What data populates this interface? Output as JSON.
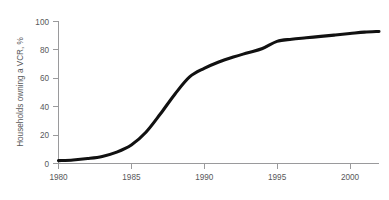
{
  "chart_data": {
    "type": "line",
    "title": "",
    "subtitle": "",
    "xlabel": "",
    "ylabel": "Households owning a VCR, %",
    "xlim": [
      1980,
      2002
    ],
    "ylim": [
      0,
      100
    ],
    "grid": false,
    "legend": "none",
    "x_ticks": [
      1980,
      1985,
      1990,
      1995,
      2000
    ],
    "x_tick_labels": [
      "1980",
      "1985",
      "1990",
      "1995",
      "2000"
    ],
    "y_ticks": [
      0,
      20,
      40,
      60,
      80,
      100
    ],
    "y_tick_labels": [
      "0",
      "20",
      "40",
      "60",
      "80",
      "100"
    ],
    "series": [
      {
        "name": "Households owning a VCR",
        "color": "#111111",
        "x": [
          1980,
          1981,
          1982,
          1983,
          1984,
          1985,
          1986,
          1987,
          1988,
          1989,
          1990,
          1991,
          1992,
          1993,
          1994,
          1995,
          1996,
          1997,
          1998,
          1999,
          2000,
          2001,
          2002
        ],
        "values": [
          2,
          2.5,
          3.5,
          5,
          8,
          13,
          22,
          35,
          49,
          61,
          67,
          71.5,
          75,
          78,
          81,
          86,
          87.5,
          88.5,
          89.5,
          90.5,
          91.5,
          92.5,
          93
        ]
      }
    ],
    "annotations": []
  },
  "figure": {
    "axis_color": "#9a9a9c",
    "background": "#ffffff",
    "text_color": "#58585a"
  }
}
